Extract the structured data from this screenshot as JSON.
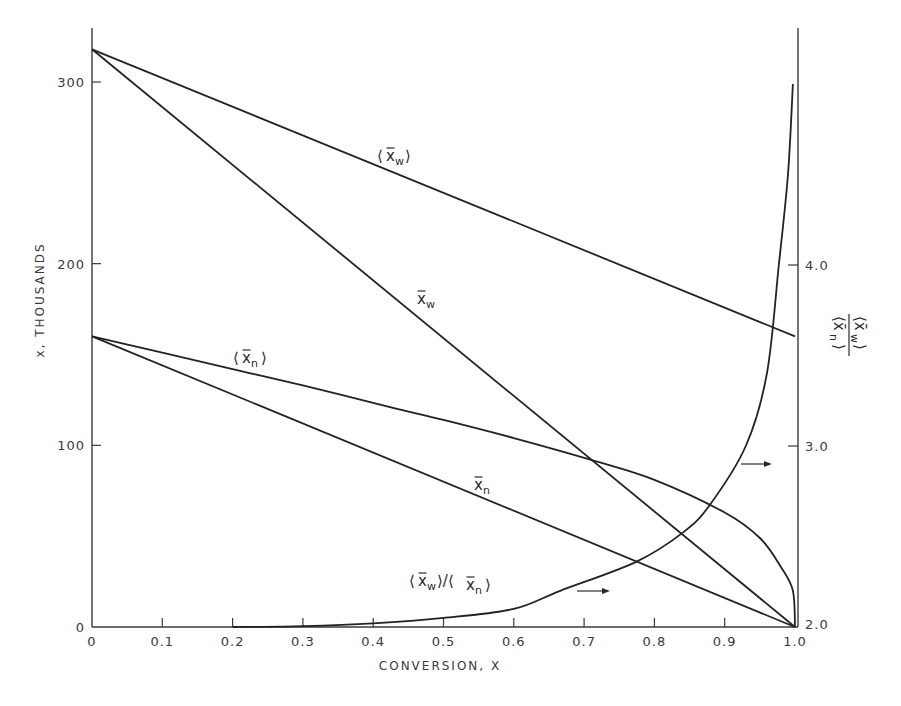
{
  "chart_data": {
    "type": "line",
    "title": "",
    "xlabel": "CONVERSION, X",
    "ylabel": "x, THOUSANDS",
    "y2label": "<x̄w>/<x̄n>",
    "xlim": [
      0,
      1.0
    ],
    "ylim": [
      0,
      330
    ],
    "y2lim": [
      2.0,
      5.0
    ],
    "grid": false,
    "x_ticks": [
      "0",
      "0.1",
      "0.2",
      "0.3",
      "0.4",
      "0.5",
      "0.6",
      "0.7",
      "0.8",
      "0.9",
      "1.0"
    ],
    "y_ticks": [
      "0",
      "100",
      "200",
      "300"
    ],
    "y2_ticks": [
      "2.0",
      "3.0",
      "4.0"
    ],
    "series": [
      {
        "name": "<x̄w>",
        "axis": "left",
        "label": "⟨x̄w⟩",
        "x": [
          0,
          1.0
        ],
        "y": [
          318,
          160
        ]
      },
      {
        "name": "x̄w",
        "axis": "left",
        "label": "x̄w",
        "x": [
          0,
          1.0
        ],
        "y": [
          318,
          0
        ]
      },
      {
        "name": "<x̄n>",
        "axis": "left",
        "label": "⟨x̄n⟩",
        "x": [
          0,
          0.1,
          0.2,
          0.3,
          0.424,
          0.5,
          0.6,
          0.71,
          0.8,
          0.9,
          0.95,
          0.98,
          0.997,
          1.0
        ],
        "y": [
          160,
          151,
          142,
          133,
          121,
          114,
          104,
          92,
          81,
          63,
          49,
          33,
          20,
          0
        ]
      },
      {
        "name": "x̄n",
        "axis": "left",
        "label": "x̄n",
        "x": [
          0,
          1.0
        ],
        "y": [
          160,
          0
        ]
      },
      {
        "name": "<x̄w>/<x̄n>",
        "axis": "right",
        "label": "⟨x̄w⟩/⟨x̄n⟩",
        "x": [
          0.2,
          0.3,
          0.4,
          0.5,
          0.6,
          0.666,
          0.774,
          0.84,
          0.878,
          0.93,
          0.96,
          0.977,
          0.99,
          0.997
        ],
        "y": [
          2.0,
          2.005,
          2.02,
          2.05,
          2.1,
          2.2,
          2.36,
          2.52,
          2.67,
          3.0,
          3.4,
          4.0,
          4.5,
          5.0
        ]
      }
    ],
    "annotations": [
      {
        "text": "→",
        "target": "right axis",
        "near_curve": "<x̄w>/<x̄n>",
        "x": 0.55,
        "y_right": 2.1
      },
      {
        "text": "→",
        "target": "right axis",
        "near_curve": "<x̄w>/<x̄n>",
        "x": 0.95,
        "y_right": 2.9
      }
    ]
  },
  "labels": {
    "xlabel": "CONVERSION, X",
    "ylabel": "x, THOUSANDS",
    "curve_xw_avg": "x̄",
    "curve_xw_avg_sub": "w",
    "curve_xw": "x̄",
    "curve_xw_sub": "w",
    "curve_xn_avg": "x̄",
    "curve_xn_avg_sub": "n",
    "curve_xn": "x̄",
    "curve_xn_sub": "n",
    "ratio_label": "⟨x̄w⟩/⟨x̄n⟩"
  }
}
